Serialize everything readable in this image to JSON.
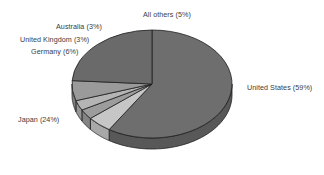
{
  "chart_data": {
    "type": "pie",
    "title": "",
    "subtitle": "",
    "xlabel": "",
    "ylabel": "",
    "legend_position": "none",
    "grid": false,
    "style": "3d-pie",
    "start_angle_deg": 0,
    "direction": "clockwise",
    "categories": [
      "United States",
      "All others",
      "Australia",
      "United Kingdom",
      "Germany",
      "Japan"
    ],
    "values": [
      59,
      5,
      3,
      3,
      6,
      24
    ],
    "unit": "%",
    "slices": [
      {
        "name": "United States",
        "value": 59,
        "label": "United States (59%)",
        "color": "#6e6e6e",
        "side_color": "#585858"
      },
      {
        "name": "All others",
        "value": 5,
        "label": "All others (5%)",
        "color": "#c6c6c6",
        "side_color": "#a8a8a8"
      },
      {
        "name": "Australia",
        "value": 3,
        "label": "Australia (3%)",
        "color": "#9c9c9c",
        "side_color": "#848484"
      },
      {
        "name": "United Kingdom",
        "value": 3,
        "label": "United Kingdom (3%)",
        "color": "#b4b4b4",
        "side_color": "#969696"
      },
      {
        "name": "Germany",
        "value": 6,
        "label": "Germany (6%)",
        "color": "#9a9a9a",
        "side_color": "#7e7e7e"
      },
      {
        "name": "Japan",
        "value": 24,
        "label": "Japan (24%)",
        "color": "#6a6a6a",
        "side_color": "#545454"
      }
    ]
  },
  "labels": {
    "united_states": "United States (59%)",
    "japan": "Japan (24%)",
    "germany": "Germany (6%)",
    "united_kingdom": "United Kingdom (3%)",
    "australia": "Australia (3%)",
    "all_others": "All others (5%)"
  },
  "colors": {
    "background": "#ffffff",
    "outline": "#1e1e1e",
    "label_text": "#3c3c3c"
  }
}
